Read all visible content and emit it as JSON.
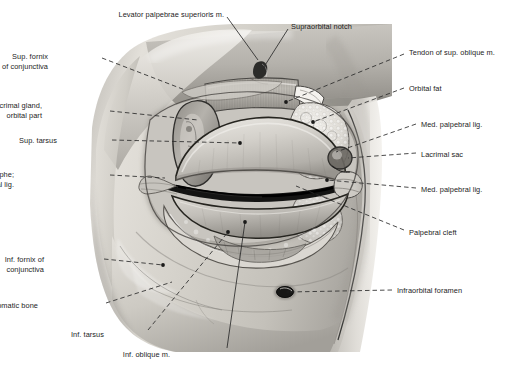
{
  "figure": {
    "background_color": "#ffffff",
    "text_color": "#1c1c1c",
    "leader_color": "#2a2a2a"
  },
  "labels": [
    {
      "id": "levator-palpebrae-superioris",
      "text_lines": [
        "Levator palpebrae superioris m."
      ],
      "side": "top",
      "align": "right",
      "x": 224,
      "y": 10,
      "leader": {
        "style": "solid",
        "points": [
          [
            227,
            17
          ],
          [
            258,
            60
          ]
        ]
      },
      "terminator": "none"
    },
    {
      "id": "supraorbital-notch",
      "text_lines": [
        "Supraorbital notch"
      ],
      "side": "top",
      "align": "left",
      "x": 291,
      "y": 22,
      "leader": {
        "style": "solid",
        "points": [
          [
            288,
            29
          ],
          [
            262,
            70
          ]
        ]
      },
      "terminator": "none"
    },
    {
      "id": "sup-fornix-of-conjunctiva",
      "text_lines": [
        "Sup. fornix",
        "of conjunctiva"
      ],
      "side": "left",
      "align": "right",
      "x": 48,
      "y": 52,
      "leader": {
        "style": "dashed",
        "points": [
          [
            102,
            58
          ],
          [
            185,
            90
          ]
        ]
      },
      "terminator": "none"
    },
    {
      "id": "lacrimal-gland-orbital-part",
      "text_lines": [
        "Lacrimal gland,",
        "orbital part"
      ],
      "side": "left",
      "align": "right",
      "x": 42,
      "y": 101,
      "leader": {
        "style": "dashed",
        "points": [
          [
            110,
            111
          ],
          [
            198,
            120
          ]
        ]
      },
      "terminator": "none"
    },
    {
      "id": "sup-tarsus",
      "text_lines": [
        "Sup. tarsus"
      ],
      "side": "left",
      "align": "right",
      "x": 57,
      "y": 136,
      "leader": {
        "style": "dashed",
        "points": [
          [
            112,
            140
          ],
          [
            240,
            143
          ]
        ]
      },
      "terminator": "dot"
    },
    {
      "id": "lat-palpebral-raphe-lig",
      "text_lines": [
        "Lat. palpebral raphe;",
        "Lat. palpebral lig."
      ],
      "side": "left",
      "align": "right",
      "x": 14,
      "y": 170,
      "leader": {
        "style": "dashed",
        "points": [
          [
            110,
            175
          ],
          [
            165,
            178
          ]
        ]
      },
      "terminator": "none"
    },
    {
      "id": "inf-fornix-of-conjunctiva",
      "text_lines": [
        "Inf. fornix of",
        "conjunctiva"
      ],
      "side": "left",
      "align": "right",
      "x": 44,
      "y": 255,
      "leader": {
        "style": "dashed",
        "points": [
          [
            104,
            259
          ],
          [
            163,
            265
          ]
        ]
      },
      "terminator": "dot"
    },
    {
      "id": "zygomatic-bone",
      "text_lines": [
        "Zygomatic bone"
      ],
      "side": "left",
      "align": "right",
      "x": 38,
      "y": 301,
      "leader": {
        "style": "dashed",
        "points": [
          [
            106,
            303
          ],
          [
            172,
            282
          ]
        ]
      },
      "terminator": "none"
    },
    {
      "id": "inf-tarsus",
      "text_lines": [
        "Inf. tarsus"
      ],
      "side": "bottom",
      "align": "right",
      "x": 104,
      "y": 330,
      "leader": {
        "style": "dashed",
        "points": [
          [
            148,
            330
          ],
          [
            228,
            232
          ]
        ]
      },
      "terminator": "dot"
    },
    {
      "id": "inf-oblique-m",
      "text_lines": [
        "Inf. oblique m."
      ],
      "side": "bottom",
      "align": "right",
      "x": 170,
      "y": 350,
      "leader": {
        "style": "solid",
        "points": [
          [
            227,
            348
          ],
          [
            245,
            222
          ]
        ]
      },
      "terminator": "dot"
    },
    {
      "id": "tendon-of-sup-oblique-m",
      "text_lines": [
        "Tendon of sup. oblique m."
      ],
      "side": "right",
      "align": "left",
      "x": 409,
      "y": 48,
      "leader": {
        "style": "dashed",
        "points": [
          [
            404,
            54
          ],
          [
            286,
            102
          ]
        ]
      },
      "terminator": "dot"
    },
    {
      "id": "orbital-fat",
      "text_lines": [
        "Orbital fat"
      ],
      "side": "right",
      "align": "left",
      "x": 409,
      "y": 84,
      "leader": {
        "style": "dashed",
        "points": [
          [
            404,
            88
          ],
          [
            313,
            122
          ]
        ]
      },
      "terminator": "dot"
    },
    {
      "id": "med-palpebral-lig-upper",
      "text_lines": [
        "Med. palpebral lig."
      ],
      "side": "right",
      "align": "left",
      "x": 421,
      "y": 120,
      "leader": {
        "style": "dashed",
        "points": [
          [
            416,
            124
          ],
          [
            336,
            152
          ]
        ]
      },
      "terminator": "none"
    },
    {
      "id": "lacrimal-sac",
      "text_lines": [
        "Lacrimal sac"
      ],
      "side": "right",
      "align": "left",
      "x": 421,
      "y": 150,
      "leader": {
        "style": "dashed",
        "points": [
          [
            416,
            153
          ],
          [
            348,
            158
          ]
        ]
      },
      "terminator": "none"
    },
    {
      "id": "med-palpebral-lig-lower",
      "text_lines": [
        "Med. palpebral lig."
      ],
      "side": "right",
      "align": "left",
      "x": 421,
      "y": 185,
      "leader": {
        "style": "dashed",
        "points": [
          [
            416,
            188
          ],
          [
            327,
            180
          ]
        ]
      },
      "terminator": "dot"
    },
    {
      "id": "palpebral-cleft",
      "text_lines": [
        "Palpebral cleft"
      ],
      "side": "right",
      "align": "left",
      "x": 409,
      "y": 228,
      "leader": {
        "style": "dashed",
        "points": [
          [
            404,
            230
          ],
          [
            296,
            186
          ]
        ]
      },
      "terminator": "none"
    },
    {
      "id": "infraorbital-foramen",
      "text_lines": [
        "Infraorbital foramen"
      ],
      "side": "right",
      "align": "left",
      "x": 397,
      "y": 286,
      "leader": {
        "style": "dashed",
        "points": [
          [
            392,
            290
          ],
          [
            288,
            292
          ]
        ]
      },
      "terminator": "dot"
    }
  ]
}
